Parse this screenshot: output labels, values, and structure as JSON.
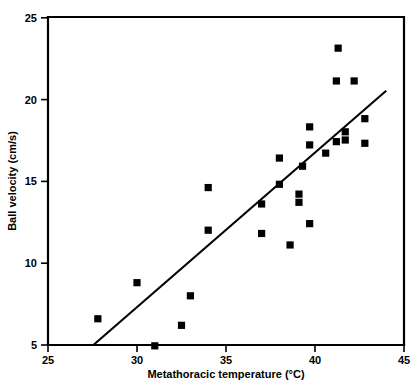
{
  "chart_data": {
    "type": "scatter",
    "title": "",
    "xlabel": "Metathoracic temperature (°C)",
    "ylabel": "Ball velocity (cm/s)",
    "xlim": [
      25,
      45
    ],
    "ylim": [
      5,
      25
    ],
    "xticks": [
      25,
      30,
      35,
      40,
      45
    ],
    "yticks": [
      5,
      10,
      15,
      20,
      25
    ],
    "xtick_labels": [
      "25",
      "30",
      "35",
      "40",
      "45"
    ],
    "ytick_labels": [
      "5",
      "10",
      "15",
      "20",
      "25"
    ],
    "grid": false,
    "legend": null,
    "marker": "square",
    "marker_color": "#000000",
    "points": [
      {
        "x": 27.8,
        "y": 6.6
      },
      {
        "x": 30.0,
        "y": 8.8
      },
      {
        "x": 31.0,
        "y": 4.95
      },
      {
        "x": 32.5,
        "y": 6.2
      },
      {
        "x": 33.0,
        "y": 8.0
      },
      {
        "x": 34.0,
        "y": 12.0
      },
      {
        "x": 34.0,
        "y": 14.6
      },
      {
        "x": 37.0,
        "y": 11.8
      },
      {
        "x": 37.0,
        "y": 13.6
      },
      {
        "x": 38.0,
        "y": 14.8
      },
      {
        "x": 38.0,
        "y": 16.4
      },
      {
        "x": 38.6,
        "y": 11.1
      },
      {
        "x": 39.1,
        "y": 13.7
      },
      {
        "x": 39.1,
        "y": 14.2
      },
      {
        "x": 39.3,
        "y": 15.9
      },
      {
        "x": 39.7,
        "y": 12.4
      },
      {
        "x": 39.7,
        "y": 17.2
      },
      {
        "x": 39.7,
        "y": 18.3
      },
      {
        "x": 40.6,
        "y": 16.7
      },
      {
        "x": 41.2,
        "y": 17.4
      },
      {
        "x": 41.2,
        "y": 21.1
      },
      {
        "x": 41.3,
        "y": 23.1
      },
      {
        "x": 41.7,
        "y": 17.5
      },
      {
        "x": 41.7,
        "y": 18.0
      },
      {
        "x": 42.2,
        "y": 21.1
      },
      {
        "x": 42.8,
        "y": 17.3
      },
      {
        "x": 42.8,
        "y": 18.8
      }
    ],
    "fit_line": {
      "type": "linear-regression",
      "x_start": 27.55,
      "y_start": 5.0,
      "x_end": 44.0,
      "y_end": 20.5
    },
    "annotations": []
  }
}
